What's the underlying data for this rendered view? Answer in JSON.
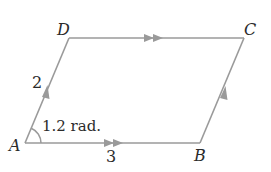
{
  "diagram": {
    "type": "parallelogram",
    "vertices": {
      "A": {
        "label": "A",
        "x": 25,
        "y": 143
      },
      "B": {
        "label": "B",
        "x": 200,
        "y": 143
      },
      "C": {
        "label": "C",
        "x": 244,
        "y": 38
      },
      "D": {
        "label": "D",
        "x": 69,
        "y": 38
      }
    },
    "sides": {
      "AD": {
        "label": "2",
        "arrow": "single"
      },
      "AB": {
        "label": "3",
        "arrow": "double"
      },
      "DC": {
        "arrow": "double"
      },
      "BC": {
        "arrow": "single"
      }
    },
    "angle": {
      "vertex": "A",
      "label": "1.2 rad."
    },
    "colors": {
      "line": "#9a9a9a",
      "text": "#2b2b2b"
    }
  }
}
